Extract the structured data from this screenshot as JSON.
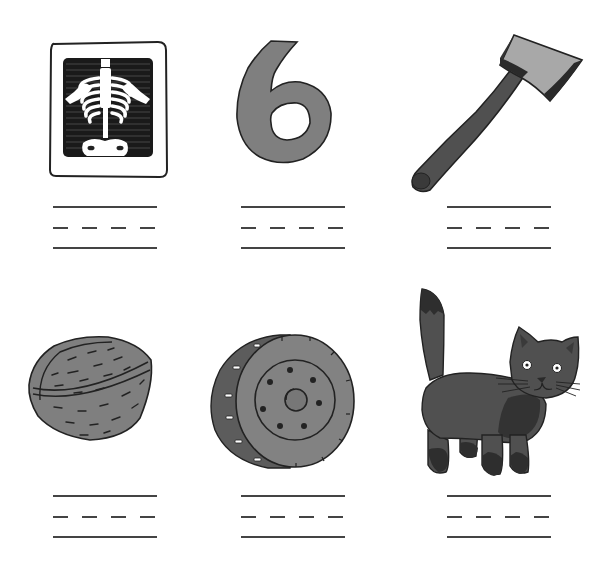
{
  "worksheet": {
    "type": "picture-word writing worksheet",
    "layout": {
      "rows": 2,
      "columns": 3
    },
    "items": [
      {
        "picture": "x-ray",
        "answer_value": "",
        "row": 1,
        "col": 1
      },
      {
        "picture": "six",
        "answer_value": "",
        "row": 1,
        "col": 2
      },
      {
        "picture": "axe",
        "answer_value": "",
        "row": 1,
        "col": 3
      },
      {
        "picture": "walnut",
        "answer_value": "",
        "row": 2,
        "col": 1
      },
      {
        "picture": "tire",
        "answer_value": "",
        "row": 2,
        "col": 2
      },
      {
        "picture": "cat",
        "answer_value": "",
        "row": 2,
        "col": 3
      }
    ],
    "writing_lines": {
      "solid_top": true,
      "dashed_mid": true,
      "solid_bottom": true,
      "dash_count": 4
    }
  },
  "colors": {
    "background": "#ffffff",
    "ink": "#222222",
    "line": "#444444",
    "gray_fill": "#7f7f7f",
    "light_gray": "#a8a8a8",
    "dark_gray": "#4a4a4a",
    "cat_fill": "#505050",
    "cat_dark": "#303030"
  }
}
